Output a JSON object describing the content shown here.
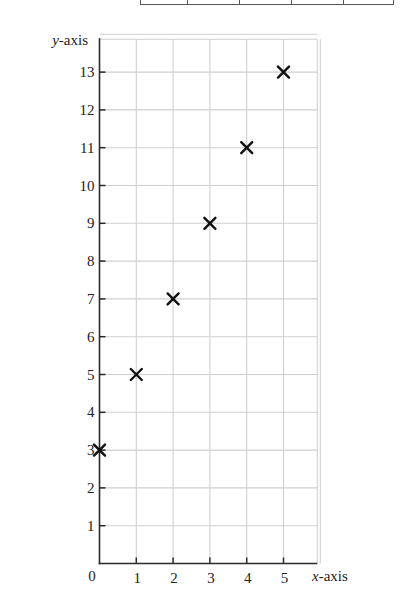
{
  "top_table": {
    "cell_widths": [
      47,
      52,
      52,
      52,
      51
    ]
  },
  "chart_data": {
    "type": "scatter",
    "title": "",
    "xlabel": "x-axis",
    "ylabel": "y-axis",
    "xlabel_italic_part": "x",
    "xlabel_rest": "-axis",
    "ylabel_italic_part": "y",
    "ylabel_rest": "-axis",
    "x": [
      0,
      1,
      2,
      3,
      4,
      5
    ],
    "y": [
      3,
      5,
      7,
      9,
      11,
      13
    ],
    "marker": "x",
    "xlim": [
      0,
      6
    ],
    "ylim": [
      0,
      14
    ],
    "x_ticks": [
      1,
      2,
      3,
      4,
      5
    ],
    "y_ticks": [
      1,
      2,
      3,
      4,
      5,
      6,
      7,
      8,
      9,
      10,
      11,
      12,
      13
    ],
    "origin_label": "0",
    "grid": true,
    "legend": null,
    "colors": {
      "axis": "#2a2a2a",
      "grid": "#cfcfcf",
      "marker": "#111111"
    }
  }
}
